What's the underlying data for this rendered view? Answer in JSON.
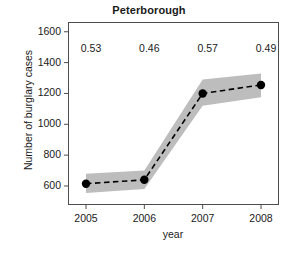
{
  "chart_data": {
    "type": "line",
    "title": "Peterborough",
    "xlabel": "year",
    "ylabel": "Number of burglary cases",
    "x": [
      2005,
      2006,
      2007,
      2008
    ],
    "xtick_labels": [
      "2005",
      "2006",
      "2007",
      "2008"
    ],
    "ytick_labels": [
      "600",
      "800",
      "1000",
      "1200",
      "1400",
      "1600"
    ],
    "ytick_values": [
      600,
      800,
      1000,
      1200,
      1400,
      1600
    ],
    "ylim": [
      480,
      1660
    ],
    "xlim": [
      2004.7,
      2008.3
    ],
    "grid": false,
    "legend": null,
    "series": [
      {
        "name": "Number of burglary cases",
        "values": [
          615,
          640,
          1200,
          1255
        ],
        "line_style": "dashed",
        "line_color": "#000000",
        "marker": "filled-circle",
        "marker_color": "#000000"
      }
    ],
    "confidence_band": {
      "name": "confidence interval",
      "fill_color": "#bdbdbd",
      "lower": [
        555,
        580,
        1120,
        1175
      ],
      "upper": [
        680,
        700,
        1290,
        1330
      ]
    },
    "annotations": [
      {
        "label": "0.53",
        "x": 2005,
        "y": 1490
      },
      {
        "label": "0.46",
        "x": 2006,
        "y": 1490
      },
      {
        "label": "0.57",
        "x": 2007,
        "y": 1490
      },
      {
        "label": "0.49",
        "x": 2008,
        "y": 1490
      }
    ]
  },
  "colors": {
    "band": "#bdbdbd",
    "line": "#000000",
    "axis": "#4d4d4d",
    "text": "#1a1a1a",
    "background": "#ffffff"
  }
}
